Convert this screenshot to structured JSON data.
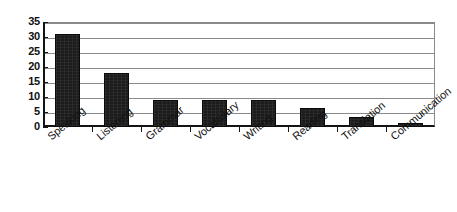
{
  "chart_data": {
    "type": "bar",
    "title": "",
    "subtitle": "",
    "xlabel": "",
    "ylabel": "",
    "categories": [
      "Speaking",
      "Listening",
      "Grammar",
      "Vocabulary",
      "Writing",
      "Reading",
      "Translation",
      "Communication"
    ],
    "values": [
      31,
      18,
      9,
      9,
      9,
      6.5,
      3.5,
      1.5
    ],
    "ylim": [
      0,
      35
    ],
    "ytick_labels": [
      "0",
      "5",
      "10",
      "15",
      "20",
      "25",
      "30",
      "35"
    ],
    "ytick_values": [
      0,
      5,
      10,
      15,
      20,
      25,
      30,
      35
    ],
    "grid": true,
    "legend": false,
    "legend_position": "none",
    "bar_color": "#1c1c1c",
    "gridline_color": "#8a8a8a",
    "axis_color": "#141414",
    "background_color": "#ffffff"
  }
}
